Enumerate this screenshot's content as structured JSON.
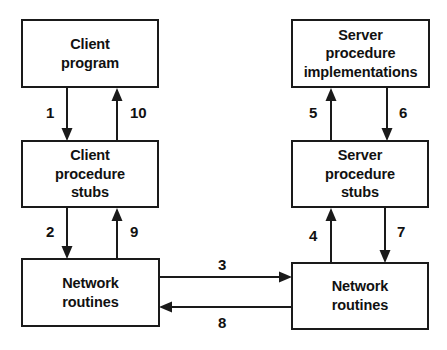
{
  "diagram": {
    "background_color": "#ffffff",
    "stroke_color": "#1a1a1a",
    "text_color": "#111111",
    "nodes": [
      {
        "id": "client-program",
        "label": "Client\nprogram"
      },
      {
        "id": "client-stubs",
        "label": "Client\nprocedure\nstubs"
      },
      {
        "id": "client-network",
        "label": "Network\nroutines"
      },
      {
        "id": "server-impl",
        "label": "Server\nprocedure\nimplementations"
      },
      {
        "id": "server-stubs",
        "label": "Server\nprocedure\nstubs"
      },
      {
        "id": "server-network",
        "label": "Network\nroutines"
      }
    ],
    "edges": [
      {
        "id": "1",
        "label": "1",
        "from": "client-program",
        "to": "client-stubs",
        "direction": "down"
      },
      {
        "id": "2",
        "label": "2",
        "from": "client-stubs",
        "to": "client-network",
        "direction": "down"
      },
      {
        "id": "3",
        "label": "3",
        "from": "client-network",
        "to": "server-network",
        "direction": "right"
      },
      {
        "id": "4",
        "label": "4",
        "from": "server-network",
        "to": "server-stubs",
        "direction": "up"
      },
      {
        "id": "5",
        "label": "5",
        "from": "server-stubs",
        "to": "server-impl",
        "direction": "up"
      },
      {
        "id": "6",
        "label": "6",
        "from": "server-impl",
        "to": "server-stubs",
        "direction": "down"
      },
      {
        "id": "7",
        "label": "7",
        "from": "server-stubs",
        "to": "server-network",
        "direction": "down"
      },
      {
        "id": "8",
        "label": "8",
        "from": "server-network",
        "to": "client-network",
        "direction": "left"
      },
      {
        "id": "9",
        "label": "9",
        "from": "client-network",
        "to": "client-stubs",
        "direction": "up"
      },
      {
        "id": "10",
        "label": "10",
        "from": "client-stubs",
        "to": "client-program",
        "direction": "up"
      }
    ]
  }
}
